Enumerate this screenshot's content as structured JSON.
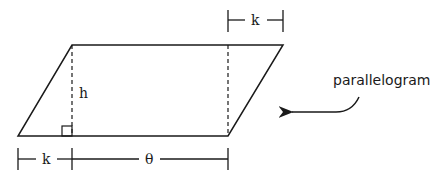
{
  "diagram": {
    "title": "parallelogram",
    "callout_label": "parallelogram",
    "height_label": "h",
    "top_offset_label": "k",
    "bottom_offset_label": "k",
    "base_label": "θ",
    "colors": {
      "stroke": "#1a1a1a",
      "background": "#ffffff"
    },
    "shape": {
      "type": "parallelogram",
      "vertices": {
        "top_left": [
          72,
          45
        ],
        "top_right": [
          283,
          45
        ],
        "bottom_right": [
          228,
          136
        ],
        "bottom_left": [
          18,
          136
        ]
      }
    }
  }
}
